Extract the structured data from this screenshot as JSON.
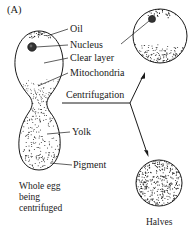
{
  "figure": {
    "panel_label": "(A)",
    "labels": {
      "oil": "Oil",
      "nucleus": "Nucleus",
      "clear_layer": "Clear layer",
      "mitochondria": "Mitochondria",
      "centrifugation": "Centrifugation",
      "yolk": "Yolk",
      "pigment": "Pigment"
    },
    "whole_egg_caption": [
      "Whole egg",
      "being",
      "centrifuged"
    ],
    "halves_caption": "Halves",
    "colors": {
      "ink": "#1a1a1a",
      "background": "#ffffff"
    }
  }
}
